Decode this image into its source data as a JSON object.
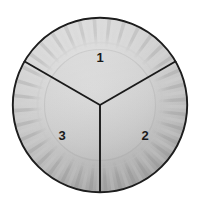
{
  "diagram": {
    "object": "paper plate",
    "sector_count": 3,
    "labels": [
      {
        "id": "label-1",
        "text": "1",
        "sector": "top",
        "cx": 100,
        "cy": 58
      },
      {
        "id": "label-2",
        "text": "2",
        "sector": "lower-right",
        "cx": 145,
        "cy": 136
      },
      {
        "id": "label-3",
        "text": "3",
        "sector": "lower-left",
        "cx": 62,
        "cy": 136
      }
    ],
    "geometry": {
      "center_x": 100,
      "center_y": 105,
      "outer_radius": 88,
      "rim_inner_radius": 63,
      "well_radius": 55,
      "divider_angles_deg": [
        90,
        210,
        330
      ],
      "ridge_count": 72
    },
    "colors": {
      "background": "#ffffff",
      "outline": "#1a1a1a",
      "divider": "#1a1a1a",
      "plate_light": "#d7d7d7",
      "plate_mid": "#c6c6c6",
      "plate_shadow": "#a9a9a9",
      "rim_ridge_light": "#cfcfcf",
      "rim_ridge_dark": "#a6a6a6",
      "well_edge": "#c0c0c0",
      "label_text": "#1a1a1a"
    }
  }
}
